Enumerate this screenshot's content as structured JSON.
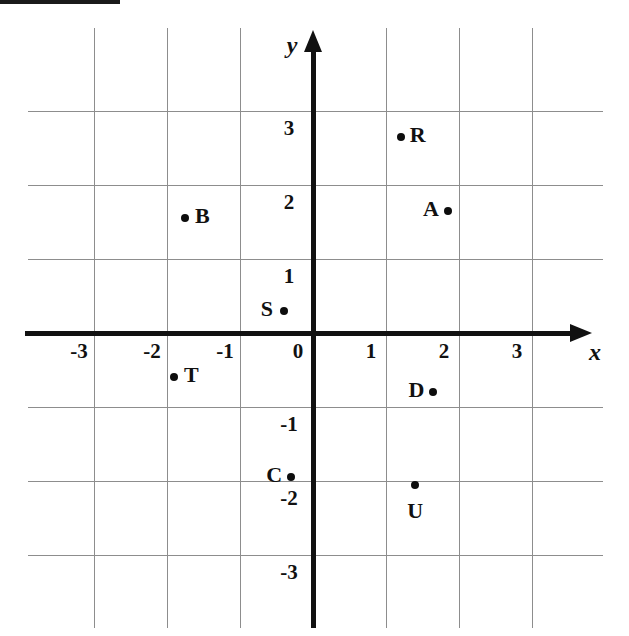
{
  "figure": {
    "type": "coordinate-plane",
    "background_color": "#ffffff",
    "line_color": "#111111",
    "grid_color": "#8d8d8d",
    "point_color": "#0d0d0d",
    "x_axis_label": "x",
    "y_axis_label": "y",
    "origin_label": "0"
  },
  "axes": {
    "x_ticks": [
      "-3",
      "-2",
      "-1",
      "0",
      "1",
      "2",
      "3"
    ],
    "y_ticks": [
      "3",
      "2",
      "1",
      "-1",
      "-2",
      "-3"
    ]
  },
  "chart_data": {
    "type": "scatter",
    "title": "",
    "xlabel": "x",
    "ylabel": "y",
    "xlim": [
      -3.6,
      3.9
    ],
    "ylim": [
      -3.6,
      3.5
    ],
    "grid": true,
    "legend": "none",
    "xticks": [
      -3,
      -2,
      -1,
      0,
      1,
      2,
      3
    ],
    "yticks": [
      -3,
      -2,
      -1,
      1,
      2,
      3
    ],
    "points": [
      {
        "label": "R",
        "x": 1.2,
        "y": 2.65,
        "label_side": "right"
      },
      {
        "label": "A",
        "x": 1.85,
        "y": 1.65,
        "label_side": "left"
      },
      {
        "label": "B",
        "x": -1.75,
        "y": 1.55,
        "label_side": "right"
      },
      {
        "label": "S",
        "x": -0.4,
        "y": 0.3,
        "label_side": "left"
      },
      {
        "label": "T",
        "x": -1.9,
        "y": -0.6,
        "label_side": "right"
      },
      {
        "label": "D",
        "x": 1.65,
        "y": -0.8,
        "label_side": "left"
      },
      {
        "label": "C",
        "x": -0.3,
        "y": -1.95,
        "label_side": "left"
      },
      {
        "label": "U",
        "x": 1.4,
        "y": -2.05,
        "label_side": "below"
      }
    ]
  }
}
